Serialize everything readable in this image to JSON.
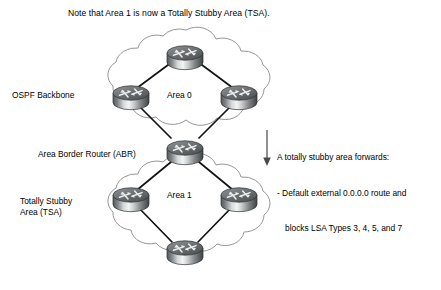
{
  "figure": {
    "title_note": "Note that Area 1 is now a Totally Stubby Area (TSA).",
    "width": 441,
    "height": 290,
    "background_color": "#ffffff"
  },
  "labels": {
    "ospf_backbone": "OSPF Backbone",
    "area_border_router": "Area Border Router (ABR)",
    "totally_stubby_line1": "Totally Stubby",
    "totally_stubby_line2": "Area (TSA)",
    "area_0": "Area 0",
    "area_1": "Area 1"
  },
  "annotation": {
    "line1": "A totally stubby area forwards:",
    "line2": "- Default external 0.0.0.0 route and",
    "line3": "blocks LSA Types 3, 4, 5, and 7"
  },
  "areas": [
    {
      "id": "area-0",
      "name": "Area 0",
      "role": "OSPF Backbone",
      "router_count": 4
    },
    {
      "id": "area-1",
      "name": "Area 1",
      "role": "Totally Stubby Area (TSA)",
      "router_count": 4
    }
  ],
  "routers": [
    {
      "id": "router-area0-top",
      "area": "Area 0",
      "position": "top"
    },
    {
      "id": "router-area0-left",
      "area": "Area 0",
      "position": "left"
    },
    {
      "id": "router-area0-right",
      "area": "Area 0",
      "position": "right"
    },
    {
      "id": "router-abr",
      "area": "Area 0 / Area 1",
      "position": "junction",
      "role": "Area Border Router (ABR)"
    },
    {
      "id": "router-area1-left",
      "area": "Area 1",
      "position": "left"
    },
    {
      "id": "router-area1-right",
      "area": "Area 1",
      "position": "right"
    },
    {
      "id": "router-area1-bottom",
      "area": "Area 1",
      "position": "bottom"
    }
  ],
  "colors": {
    "text": "#000000",
    "cloud_outline": "#7a7a7a",
    "link_line": "#111111",
    "router_body_light": "#f2f2f2",
    "router_body_mid": "#9a9a9a",
    "router_body_dark": "#4a4a4a",
    "router_top_light": "#e8e8e8",
    "router_top_dark": "#6d6d6d",
    "arrow": "#555555"
  },
  "icons": {
    "router": "router-icon",
    "cloud": "cloud-icon",
    "down_arrow": "down-arrow-icon"
  }
}
